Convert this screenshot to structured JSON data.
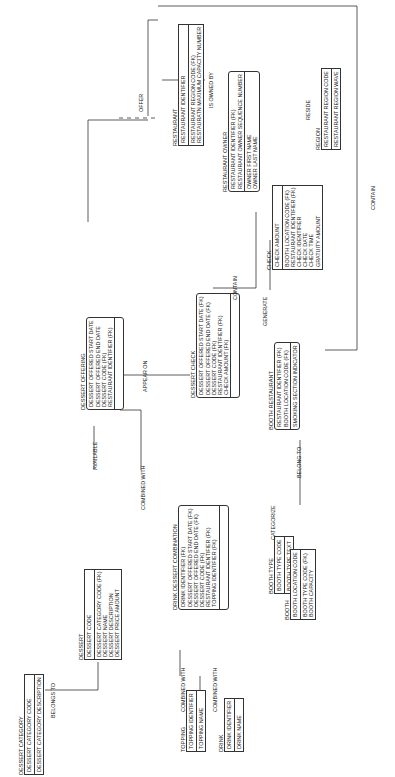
{
  "diagram": {
    "type": "entity-relationship",
    "orientation": "rotated-90-ccw",
    "entities": {
      "region": {
        "name": "REGION",
        "pk": [
          "RESTAURANT REGION CODE"
        ],
        "attrs": [
          "RESTAURANT REGION WAVE"
        ]
      },
      "restaurant": {
        "name": "RESTAURANT",
        "pk": [
          "RESTAURANT IDENTIFIER"
        ],
        "attrs": [
          "RESTAURANT REGION CODE (FK)",
          "RESTAURATN MAXIMUM CAPACITY NUMBER"
        ]
      },
      "restaurant_owner": {
        "name": "RESTAURANT OWNER",
        "pk": [
          "RESTAURANT IDENTIFIER (FK)",
          "RESTAURANT OWNER SEQUENCE NUMBER"
        ],
        "attrs": [
          "OWNER FIRST NAME",
          "OWNER LAST NAME"
        ]
      },
      "check": {
        "name": "CHECK",
        "pk": [
          "CHECK AMOUNT"
        ],
        "attrs": [
          "BOOTH LOCATION CODE (FK)",
          "RESTAURANT IDENTIFIER (FK)",
          "CHECK IDENTIFIER",
          "CHECK DATE",
          "CHECK TIME",
          "GRATUITY AMOUNT"
        ]
      },
      "booth_restaurant": {
        "name": "BOOTH RESTAURANT",
        "pk": [
          "RESTAURANT IDENTIFIER (FK)",
          "BOOTH LOCATION CODE (FK)"
        ],
        "attrs": [
          "SMOKING SECTION INDICATOR"
        ]
      },
      "dessert_check": {
        "name": "DESSERT CHECK",
        "pk": [
          "DESSERT OFFERED START DATE (FK)",
          "DESSERT OFFERED END DATE (FK)",
          "DESSERT CODE (FK)",
          "RESTAURANT IDENTIFIER (FK)",
          "CHECK AMOUNT (FK)"
        ],
        "attrs": []
      },
      "dessert_offering": {
        "name": "DESSERT OFFERING",
        "pk": [
          "DESSERT OFFERED START DATE",
          "DESSERT OFFERED END DATE",
          "DESSERT CODE (FK)",
          "RESTAURANT IDENTIFIER (FK)"
        ],
        "attrs": []
      },
      "booth_type": {
        "name": "BOOTH TYPE",
        "pk": [
          "BOOTH TYPE CODE"
        ],
        "attrs": [
          "BOOTH TYPE TEXT"
        ]
      },
      "booth": {
        "name": "BOOTH",
        "pk": [
          "BOOTH LOCATION CODE"
        ],
        "attrs": [
          "BOOTH TYPE CODE (FK)",
          "BOOTH CAPACITY"
        ]
      },
      "drink_dessert_combination": {
        "name": "DRINK DESSERT COMBINATION",
        "pk": [
          "DRINK IDENTIFIER (FK)",
          "DESSERT OFFERED START DATE (FK)",
          "DESSERT OFFERED END DATE (FK)",
          "DESSERT CODE (FK)",
          "RESTAURANT IDENTIFIER (FK)",
          "TOPPING IDENTIFIER (FK)"
        ],
        "attrs": []
      },
      "dessert": {
        "name": "DESSERT",
        "pk": [
          "DESSERT CODE"
        ],
        "attrs": [
          "DESSERT CATEGORY CODE (FK)",
          "DESSERT NAME",
          "DESSERT DESCRIPTION",
          "DESSERT PRICE AMOUNT"
        ]
      },
      "dessert_category": {
        "name": "DESSERT CATEGORY",
        "pk": [
          "DESSERT CATEGORY CODE"
        ],
        "attrs": [
          "DESSERT CATEGORY DESCRIPTION"
        ]
      },
      "topping": {
        "name": "TOPPING",
        "pk": [
          "TOPPING IDENTIFIER"
        ],
        "attrs": [
          "TOPPING NAME"
        ]
      },
      "drink": {
        "name": "DRINK",
        "pk": [
          "DRINK IDENTIFIER"
        ],
        "attrs": [
          "DRINK NAME"
        ]
      }
    },
    "relationships": {
      "reside": "RESIDE",
      "offer": "OFFER",
      "is_owned_by": "IS OWNED BY",
      "contain_check": "CONTAIN",
      "contain_booth": "CONTAIN",
      "generate": "GENERATE",
      "appear_on": "APPEAR ON",
      "available": "AVAILABLE",
      "combined_with_offering": "COMBINED WITH",
      "combined_with_topping": "COMBINED WITH",
      "combined_with_drink": "COMBINED WITH",
      "belong_to_category": "BELONGS TO",
      "belong_to_booth": "BELONG TO",
      "categorize": "CATEGORIZE"
    },
    "line_color": "#333333"
  }
}
